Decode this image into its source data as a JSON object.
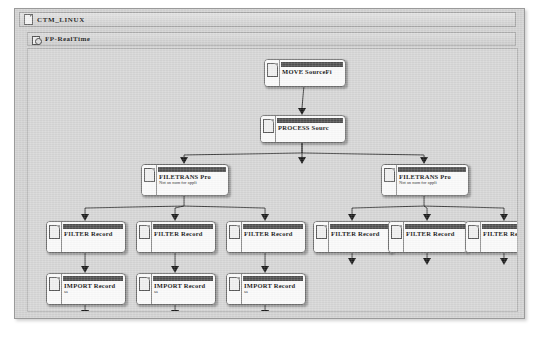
{
  "window": {
    "title": "CTM_LINUX",
    "title_icon": "document-icon",
    "subtitle": "FP-RealTime",
    "subtitle_icon": "gear-icon"
  },
  "diagram": {
    "type": "job-flow-tree",
    "nodes": [
      {
        "id": "move",
        "title": "MOVE SourceFi",
        "subtitle": "",
        "x": 236,
        "y": 10,
        "w": 80,
        "h": 26,
        "icon": "document-icon"
      },
      {
        "id": "process",
        "title": "PROCESS Sourc",
        "subtitle": "",
        "x": 232,
        "y": 66,
        "w": 84,
        "h": 26,
        "icon": "document-icon"
      },
      {
        "id": "filetrans1",
        "title": "FILETRANS Pro",
        "subtitle": "Not an num for appli",
        "x": 113,
        "y": 115,
        "w": 86,
        "h": 30,
        "icon": "document-icon"
      },
      {
        "id": "filetrans2",
        "title": "FILETRANS Pro",
        "subtitle": "Not an num for appli",
        "x": 353,
        "y": 115,
        "w": 86,
        "h": 30,
        "icon": "document-icon"
      },
      {
        "id": "filter1",
        "title": "FILTER Record",
        "subtitle": "",
        "x": 18,
        "y": 172,
        "w": 78,
        "h": 30,
        "icon": "document-icon"
      },
      {
        "id": "filter2",
        "title": "FILTER Record",
        "subtitle": "",
        "x": 108,
        "y": 172,
        "w": 78,
        "h": 30,
        "icon": "document-icon"
      },
      {
        "id": "filter3",
        "title": "FILTER Record",
        "subtitle": "",
        "x": 198,
        "y": 172,
        "w": 78,
        "h": 30,
        "icon": "document-icon"
      },
      {
        "id": "filter4",
        "title": "FILTER Record",
        "subtitle": "",
        "x": 285,
        "y": 172,
        "w": 78,
        "h": 30,
        "icon": "document-icon"
      },
      {
        "id": "filter5",
        "title": "FILTER Record",
        "subtitle": "",
        "x": 360,
        "y": 172,
        "w": 78,
        "h": 30,
        "icon": "document-icon"
      },
      {
        "id": "filter6",
        "title": "FILTER Record",
        "subtitle": "",
        "x": 437,
        "y": 172,
        "w": 78,
        "h": 30,
        "icon": "document-icon"
      },
      {
        "id": "import1",
        "title": "IMPORT Record",
        "subtitle": "sa",
        "x": 18,
        "y": 224,
        "w": 78,
        "h": 30,
        "icon": "document-icon"
      },
      {
        "id": "import2",
        "title": "IMPORT Record",
        "subtitle": "sa",
        "x": 108,
        "y": 224,
        "w": 78,
        "h": 30,
        "icon": "document-icon"
      },
      {
        "id": "import3",
        "title": "IMPORT Record",
        "subtitle": "sa",
        "x": 198,
        "y": 224,
        "w": 78,
        "h": 30,
        "icon": "document-icon"
      }
    ],
    "colors": {
      "node_fill": "#fbfbfb",
      "node_border": "#6e6e6e",
      "node_titlebar": "#4f4f4f",
      "canvas_bg": "#d6d6d6",
      "window_bg": "#d2d2d2",
      "link": "#1a1a1a"
    }
  }
}
